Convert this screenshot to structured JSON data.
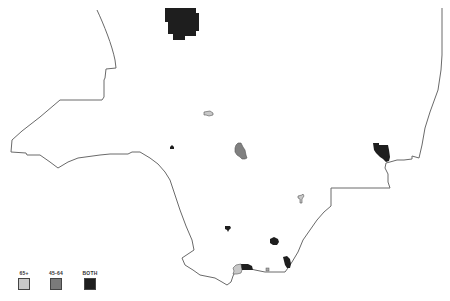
{
  "map": {
    "boundary_color": "#666666",
    "regions": [
      {
        "id": "north-top",
        "category": "both",
        "label": "BOTH",
        "color": "#1e1e1e"
      },
      {
        "id": "center-small-light",
        "category": "65plus",
        "label": "65+",
        "color": "#c8c8c8"
      },
      {
        "id": "center-left-dot",
        "category": "both",
        "label": "BOTH",
        "color": "#1e1e1e"
      },
      {
        "id": "center-mid",
        "category": "45-64",
        "label": "45-64",
        "color": "#808080"
      },
      {
        "id": "east-coast",
        "category": "both",
        "label": "BOTH",
        "color": "#1e1e1e"
      },
      {
        "id": "southeast-small-light",
        "category": "65plus",
        "label": "65+",
        "color": "#c8c8c8"
      },
      {
        "id": "south-dot-1",
        "category": "both",
        "label": "BOTH",
        "color": "#1e1e1e"
      },
      {
        "id": "south-dot-2",
        "category": "both",
        "label": "BOTH",
        "color": "#1e1e1e"
      },
      {
        "id": "south-coast-light",
        "category": "65plus",
        "label": "65+",
        "color": "#c8c8c8"
      },
      {
        "id": "south-coast-dark",
        "category": "both",
        "label": "BOTH",
        "color": "#1e1e1e"
      },
      {
        "id": "south-coast-east",
        "category": "both",
        "label": "BOTH",
        "color": "#1e1e1e"
      }
    ]
  },
  "legend": {
    "items": [
      {
        "label": "65+",
        "color": "#c8c8c8"
      },
      {
        "label": "45-64",
        "color": "#7a7a7a"
      },
      {
        "label": "BOTH",
        "color": "#1e1e1e"
      }
    ]
  }
}
